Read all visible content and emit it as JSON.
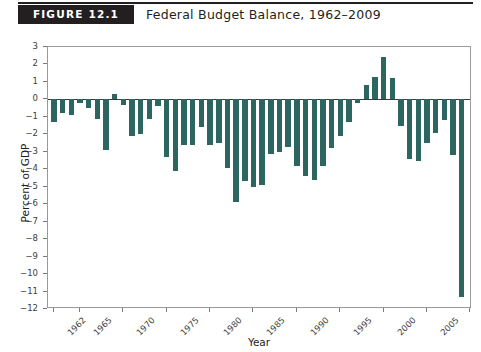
{
  "header": {
    "badge_label": "FIGURE 12.1",
    "title": "Federal Budget Balance, 1962–2009"
  },
  "colors": {
    "bar": "#2d6660",
    "badge_background": "#231f20",
    "badge_text": "#ffffff",
    "axis_line": "#9a9a9a",
    "zero_line": "#3a3a3a",
    "text": "#231f20"
  },
  "chart_data": {
    "type": "bar",
    "title": "Federal Budget Balance, 1962–2009",
    "xlabel": "Year",
    "ylabel": "Percent of GDP",
    "ylim": [
      -12,
      3
    ],
    "xlim": [
      1961.3,
      2010.2
    ],
    "grid": false,
    "legend": null,
    "y_ticks": [
      3,
      2,
      1,
      0,
      -1,
      -2,
      -3,
      -4,
      -5,
      -6,
      -7,
      -8,
      -9,
      -10,
      -11,
      -12
    ],
    "y_tick_labels": [
      "3",
      "2",
      "1",
      "0",
      "−1",
      "−2",
      "−3",
      "−4",
      "−5",
      "−6",
      "−7",
      "−8",
      "−9",
      "−10",
      "−11",
      "−12"
    ],
    "x_ticks": [
      1962,
      1965,
      1970,
      1975,
      1980,
      1985,
      1990,
      1995,
      2000,
      2005,
      2010
    ],
    "x_tick_labels": [
      "1962",
      "1965",
      "1970",
      "1975",
      "1980",
      "1985",
      "1990",
      "1995",
      "2000",
      "2005",
      "2010"
    ],
    "categories": [
      1962,
      1963,
      1964,
      1965,
      1966,
      1967,
      1968,
      1969,
      1970,
      1971,
      1972,
      1973,
      1974,
      1975,
      1976,
      1977,
      1978,
      1979,
      1980,
      1981,
      1982,
      1983,
      1984,
      1985,
      1986,
      1987,
      1988,
      1989,
      1990,
      1991,
      1992,
      1993,
      1994,
      1995,
      1996,
      1997,
      1998,
      1999,
      2000,
      2001,
      2002,
      2003,
      2004,
      2005,
      2006,
      2007,
      2008,
      2009
    ],
    "values": [
      -1.3,
      -0.8,
      -0.9,
      -0.2,
      -0.5,
      -1.1,
      -2.9,
      0.3,
      -0.3,
      -2.1,
      -2.0,
      -1.1,
      -0.4,
      -3.3,
      -4.1,
      -2.6,
      -2.6,
      -1.6,
      -2.6,
      -2.5,
      -3.9,
      -5.9,
      -4.7,
      -5.0,
      -4.9,
      -3.1,
      -3.0,
      -2.7,
      -3.8,
      -4.4,
      -4.6,
      -3.8,
      -2.8,
      -2.1,
      -1.3,
      -0.2,
      0.8,
      1.3,
      2.4,
      1.2,
      -1.5,
      -3.4,
      -3.5,
      -2.5,
      -1.9,
      -1.2,
      -3.2,
      -11.3
    ]
  }
}
